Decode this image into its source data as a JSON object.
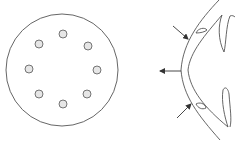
{
  "figure": {
    "colors": {
      "background": "#ffffff",
      "stroke": "#555555",
      "dot_fill": "#e6e6e6"
    },
    "left_panel": {
      "outer_circle": {
        "cx": 62,
        "cy": 70,
        "r": 56
      },
      "dots": [
        {
          "cx": 63,
          "cy": 34
        },
        {
          "cx": 88,
          "cy": 46
        },
        {
          "cx": 97,
          "cy": 70
        },
        {
          "cx": 87,
          "cy": 94
        },
        {
          "cx": 63,
          "cy": 104
        },
        {
          "cx": 39,
          "cy": 94
        },
        {
          "cx": 29,
          "cy": 69
        },
        {
          "cx": 39,
          "cy": 44
        }
      ],
      "dot_radius": 4
    },
    "right_panel": {
      "arrows": [
        {
          "name": "upper-inward-arrow",
          "x1": 173,
          "y1": 26,
          "x2": 188,
          "y2": 39
        },
        {
          "name": "outward-arrow",
          "x1": 181,
          "y1": 71,
          "x2": 160,
          "y2": 71
        },
        {
          "name": "lower-inward-arrow",
          "x1": 177,
          "y1": 118,
          "x2": 191,
          "y2": 104
        }
      ]
    }
  }
}
